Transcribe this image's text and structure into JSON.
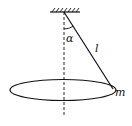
{
  "diagram": {
    "labels": {
      "angle": "α",
      "length": "l",
      "mass": "m"
    },
    "colors": {
      "line": "#111111",
      "background": "#ffffff"
    }
  }
}
